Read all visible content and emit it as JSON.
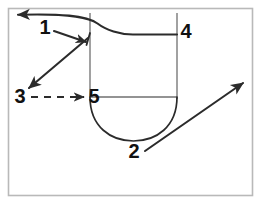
{
  "figure": {
    "canvas": {
      "width": 262,
      "height": 214
    },
    "colors": {
      "background": "#ffffff",
      "frame": "#b9b9b9",
      "outline": "#2b2b2b",
      "inner_line": "#6f6f6f",
      "label": "#111111"
    },
    "frame": {
      "x": 8,
      "y": 8,
      "width": 245,
      "height": 188
    },
    "labels": [
      {
        "id": "1",
        "text": "1",
        "x": 45,
        "y": 29
      },
      {
        "id": "2",
        "text": "2",
        "x": 134,
        "y": 153
      },
      {
        "id": "3",
        "text": "3",
        "x": 20,
        "y": 98
      },
      {
        "id": "4",
        "text": "4",
        "x": 186,
        "y": 33
      },
      {
        "id": "5",
        "text": "5",
        "x": 94,
        "y": 98
      }
    ],
    "leaders": [
      {
        "id": "leader-1",
        "from_label": "1",
        "style": "solid",
        "arrow": "end"
      },
      {
        "id": "leader-2",
        "from_label": "2",
        "style": "solid",
        "arrow": "end"
      },
      {
        "id": "leader-3",
        "from_label": "3",
        "style": "dashed",
        "arrow": "end"
      },
      {
        "id": "leader-top",
        "from_label": "4",
        "style": "solid",
        "arrow": "end"
      },
      {
        "id": "leader-diagonal",
        "from_label": "1",
        "style": "solid",
        "arrow": "end"
      }
    ],
    "geometry": {
      "left_wall_x": 90,
      "right_wall_x": 177,
      "wall_top_y": 13,
      "shoulder_y": 97,
      "bowl_bottom_y": 141,
      "top_shelf_y": 35
    }
  }
}
